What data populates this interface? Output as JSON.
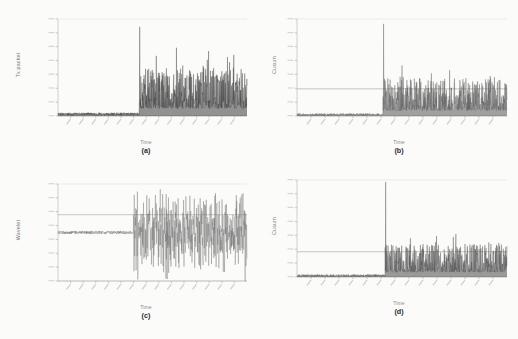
{
  "figure": {
    "background_color": "#fbfbfa",
    "panel_count": 4
  },
  "panels": [
    {
      "id": "a",
      "caption": "(a)",
      "ylabel": "Tx packet",
      "xlabel": "Time",
      "signal_color": "#3a3a3a",
      "threshold_visible": false,
      "description": "Raw transmitted packet count time series: flat low-level baseline then abrupt onset of dense high-variance burst traffic."
    },
    {
      "id": "b",
      "caption": "(b)",
      "ylabel": "Cusum",
      "xlabel": "Time",
      "signal_color": "#555555",
      "threshold_color": "#999999",
      "threshold_visible": true,
      "description": "Cusum statistic of the raw signal with horizontal detection threshold; statistic stays near zero before onset then exceeds threshold repeatedly."
    },
    {
      "id": "c",
      "caption": "(c)",
      "ylabel": "Wavelet",
      "xlabel": "Time",
      "signal_color": "#6b6b6b",
      "threshold_color": "#9a9a9a",
      "threshold_visible": true,
      "description": "Wavelet coefficient series oscillating about a mid-level baseline; amplitude expands sharply after the change point, crossing the threshold line."
    },
    {
      "id": "d",
      "caption": "(d)",
      "ylabel": "Cusum",
      "xlabel": "Time",
      "signal_color": "#4a4a4a",
      "threshold_color": "#999999",
      "threshold_visible": true,
      "description": "Cusum statistic computed on the wavelet series with horizontal detection threshold; rises above threshold after the change point."
    }
  ],
  "chart_data": [
    {
      "type": "line",
      "panel": "a",
      "title": "",
      "xlabel": "Time",
      "ylabel": "Tx packet",
      "grid": false,
      "legend": "none",
      "xlim": [
        0,
        1000
      ],
      "ylim": [
        0,
        100
      ],
      "change_point_x": 430,
      "tick_labels_legible": false,
      "series": [
        {
          "name": "Tx packet",
          "baseline_level": 2,
          "baseline_range": [
            0,
            430
          ],
          "baseline_noise_amplitude": 1.5,
          "burst_range": [
            430,
            1000
          ],
          "burst_mean": 22,
          "burst_noise_amplitude": 20,
          "spikes": [
            {
              "x": 432,
              "y": 92
            },
            {
              "x": 433,
              "y": 38
            },
            {
              "x": 520,
              "y": 62
            },
            {
              "x": 560,
              "y": 44
            },
            {
              "x": 660,
              "y": 52
            },
            {
              "x": 700,
              "y": 46
            },
            {
              "x": 790,
              "y": 58
            },
            {
              "x": 930,
              "y": 63
            }
          ]
        }
      ]
    },
    {
      "type": "line",
      "panel": "b",
      "title": "",
      "xlabel": "Time",
      "ylabel": "Cusum",
      "grid": false,
      "legend": "none",
      "xlim": [
        0,
        1000
      ],
      "ylim": [
        0,
        100
      ],
      "change_point_x": 410,
      "threshold": 28,
      "tick_labels_legible": false,
      "series": [
        {
          "name": "Cusum",
          "baseline_level": 1.5,
          "baseline_range": [
            0,
            410
          ],
          "baseline_noise_amplitude": 1.2,
          "burst_range": [
            410,
            1000
          ],
          "burst_mean": 16,
          "burst_noise_amplitude": 16,
          "spikes": [
            {
              "x": 412,
              "y": 95
            },
            {
              "x": 500,
              "y": 52
            },
            {
              "x": 505,
              "y": 40
            },
            {
              "x": 640,
              "y": 44
            },
            {
              "x": 700,
              "y": 36
            },
            {
              "x": 790,
              "y": 38
            },
            {
              "x": 880,
              "y": 34
            },
            {
              "x": 940,
              "y": 40
            }
          ]
        }
      ]
    },
    {
      "type": "line",
      "panel": "c",
      "title": "",
      "xlabel": "Time",
      "ylabel": "Wavelet",
      "grid": false,
      "legend": "none",
      "xlim": [
        0,
        1000
      ],
      "ylim": [
        -60,
        60
      ],
      "change_point_x": 400,
      "threshold": 22,
      "tick_labels_legible": false,
      "series": [
        {
          "name": "Wavelet",
          "baseline_level": 0,
          "baseline_range": [
            0,
            400
          ],
          "baseline_noise_amplitude": 2,
          "burst_range": [
            400,
            1000
          ],
          "burst_mean": 0,
          "burst_noise_amplitude": 32,
          "spikes": [
            {
              "x": 402,
              "y": -48
            },
            {
              "x": 470,
              "y": 46
            },
            {
              "x": 520,
              "y": 36
            },
            {
              "x": 560,
              "y": -40
            },
            {
              "x": 620,
              "y": 38
            },
            {
              "x": 640,
              "y": -44
            },
            {
              "x": 760,
              "y": 30
            },
            {
              "x": 880,
              "y": -36
            }
          ]
        }
      ]
    },
    {
      "type": "line",
      "panel": "d",
      "title": "",
      "xlabel": "Time",
      "ylabel": "Cusum",
      "grid": false,
      "legend": "none",
      "xlim": [
        0,
        1000
      ],
      "ylim": [
        0,
        100
      ],
      "change_point_x": 420,
      "threshold": 26,
      "tick_labels_legible": false,
      "series": [
        {
          "name": "Cusum",
          "baseline_level": 1.5,
          "baseline_range": [
            0,
            420
          ],
          "baseline_noise_amplitude": 1.2,
          "burst_range": [
            420,
            1000
          ],
          "burst_mean": 14,
          "burst_noise_amplitude": 14,
          "spikes": [
            {
              "x": 422,
              "y": 98
            },
            {
              "x": 540,
              "y": 40
            },
            {
              "x": 600,
              "y": 34
            },
            {
              "x": 660,
              "y": 36
            },
            {
              "x": 720,
              "y": 32
            },
            {
              "x": 800,
              "y": 34
            },
            {
              "x": 900,
              "y": 30
            }
          ]
        }
      ]
    }
  ]
}
